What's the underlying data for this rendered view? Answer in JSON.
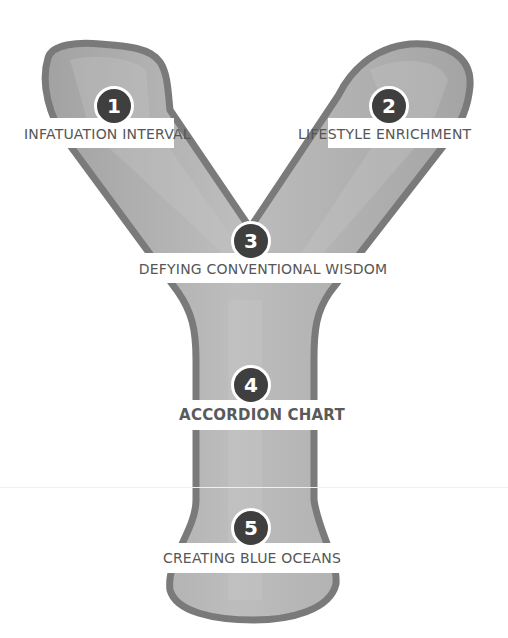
{
  "diagram": {
    "colors": {
      "outline": "#7a7a7a",
      "fill": "#a9a9a9",
      "fill_highlight": "#c2c2c2",
      "badge": "#3f3f3f",
      "band": "#ffffff",
      "label": "#565656"
    },
    "steps": [
      {
        "number": "1",
        "label": "INFATUATION INTERVAL",
        "emphasis": false
      },
      {
        "number": "2",
        "label": "LIFESTYLE ENRICHMENT",
        "emphasis": false
      },
      {
        "number": "3",
        "label": "DEFYING CONVENTIONAL WISDOM",
        "emphasis": false
      },
      {
        "number": "4",
        "label": "ACCORDION CHART",
        "emphasis": true
      },
      {
        "number": "5",
        "label": "CREATING BLUE OCEANS",
        "emphasis": false
      }
    ]
  }
}
